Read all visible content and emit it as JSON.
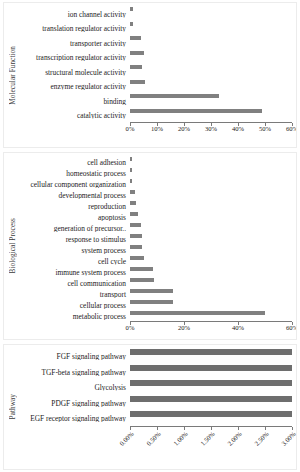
{
  "figure": {
    "background": "#ffffff",
    "bar_color": "#808080",
    "axis_color": "#7a7a7a",
    "panel_border": "#ececec"
  },
  "panels": [
    {
      "id": "molecular-function",
      "axis_title": "Molecular Function",
      "chart_data": {
        "type": "bar",
        "orientation": "horizontal",
        "title": "",
        "xlabel": "",
        "ylabel": "Molecular Function",
        "xlim": [
          0,
          60
        ],
        "xticks": [
          0,
          10,
          20,
          30,
          40,
          50,
          60
        ],
        "xticklabels": [
          "0%",
          "10%",
          "20%",
          "30%",
          "40%",
          "50%",
          "60%"
        ],
        "grid": false,
        "legend": false,
        "categories": [
          "ion channel activity",
          "translation regulator activity",
          "transporter activity",
          "transcription regulator activity",
          "structural molecule activity",
          "enzyme regulator activity",
          "binding",
          "catalytic activity"
        ],
        "values": [
          1.0,
          1.0,
          4.0,
          5.0,
          4.5,
          5.5,
          33.0,
          49.0
        ]
      }
    },
    {
      "id": "biological-process",
      "axis_title": "Biological Process",
      "chart_data": {
        "type": "bar",
        "orientation": "horizontal",
        "title": "",
        "xlabel": "",
        "ylabel": "Biological Process",
        "xlim": [
          0,
          60
        ],
        "xticks": [
          0,
          20,
          40,
          60
        ],
        "xticklabels": [
          "0%",
          "20%",
          "40%",
          "60%"
        ],
        "grid": false,
        "legend": false,
        "categories": [
          "cell adhesion",
          "homeostatic process",
          "cellular component organization",
          "developmental process",
          "reproduction",
          "apoptosis",
          "generation of precursor..",
          "response to stimulus",
          "system process",
          "cell cycle",
          "immune system process",
          "cell communication",
          "transport",
          "cellular process",
          "metabolic process"
        ],
        "values": [
          0.8,
          0.8,
          0.8,
          2.0,
          2.2,
          3.0,
          4.2,
          4.3,
          4.5,
          5.0,
          8.5,
          9.0,
          16.0,
          16.0,
          50.0
        ]
      }
    },
    {
      "id": "pathway",
      "axis_title": "Pathway",
      "chart_data": {
        "type": "bar",
        "orientation": "horizontal",
        "title": "",
        "xlabel": "",
        "ylabel": "Pathway",
        "xlim": [
          0,
          3.0
        ],
        "xticks": [
          0,
          0.5,
          1.0,
          1.5,
          2.0,
          2.5,
          3.0
        ],
        "xticklabels": [
          "0.00%",
          "0.50%",
          "1.00%",
          "1.50%",
          "2.00%",
          "2.50%",
          "3.00%"
        ],
        "grid": false,
        "legend": false,
        "categories": [
          "FGF signaling pathway",
          "TGF-beta signaling pathway",
          "Glycolysis",
          "PDGF signaling pathway",
          "EGF receptor signaling pathway"
        ],
        "values": [
          3.0,
          3.0,
          3.0,
          3.0,
          3.0
        ]
      }
    }
  ]
}
